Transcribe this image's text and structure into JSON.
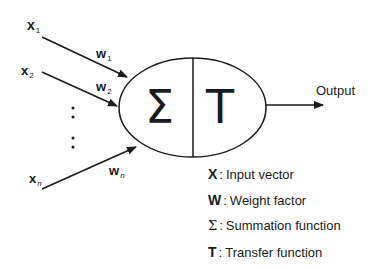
{
  "inputs": [
    {
      "var": "x",
      "sub": "1",
      "weight_var": "w",
      "weight_sub": "1"
    },
    {
      "var": "x",
      "sub": "2",
      "weight_var": "w",
      "weight_sub": "2"
    },
    {
      "var": "x",
      "sub": "n",
      "weight_var": "w",
      "weight_sub": "n"
    }
  ],
  "neuron": {
    "sum_symbol": "Σ",
    "transfer_symbol": "T"
  },
  "output_label": "Output",
  "legend": [
    {
      "symbol": "X",
      "separator": ":",
      "text": "Input vector"
    },
    {
      "symbol": "W",
      "separator": ":",
      "text": "Weight factor"
    },
    {
      "symbol": "Σ",
      "separator": ":",
      "text": "Summation function"
    },
    {
      "symbol": "T",
      "separator": ":",
      "text": "Transfer function"
    }
  ],
  "colors": {
    "stroke": "#1a1a1a",
    "background": "#ffffff"
  }
}
